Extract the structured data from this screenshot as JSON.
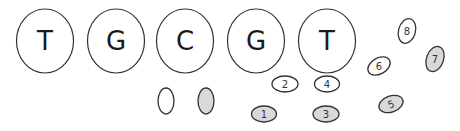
{
  "diagram": {
    "colors": {
      "stroke": "#333333",
      "fill_empty": "#ffffff",
      "fill_shaded": "#d9d9d9"
    },
    "nucleotides": [
      {
        "label": "T",
        "cx": 45,
        "cy": 41
      },
      {
        "label": "G",
        "cx": 116,
        "cy": 41
      },
      {
        "label": "C",
        "cx": 185,
        "cy": 41
      },
      {
        "label": "G",
        "cx": 256,
        "cy": 41
      },
      {
        "label": "T",
        "cx": 327,
        "cy": 41
      }
    ],
    "legend_ellipses": [
      {
        "shaded": false,
        "cx": 166,
        "cy": 101
      },
      {
        "shaded": true,
        "cx": 206,
        "cy": 101
      }
    ],
    "numbered_ellipses": [
      {
        "label": "1",
        "shaded": true,
        "cx": 264,
        "cy": 114,
        "rot": 0
      },
      {
        "label": "2",
        "shaded": false,
        "cx": 285,
        "cy": 84,
        "rot": 0
      },
      {
        "label": "3",
        "shaded": true,
        "cx": 326,
        "cy": 114,
        "rot": 0
      },
      {
        "label": "4",
        "shaded": false,
        "cx": 327,
        "cy": 84,
        "rot": 0
      },
      {
        "label": "5",
        "shaded": true,
        "cx": 391,
        "cy": 104,
        "rot": -20
      },
      {
        "label": "6",
        "shaded": false,
        "cx": 379,
        "cy": 66,
        "rot": -30
      },
      {
        "label": "7",
        "shaded": true,
        "cx": 435,
        "cy": 59,
        "rot": 20
      },
      {
        "label": "8",
        "shaded": false,
        "cx": 407,
        "cy": 31,
        "rot": 15
      }
    ]
  }
}
